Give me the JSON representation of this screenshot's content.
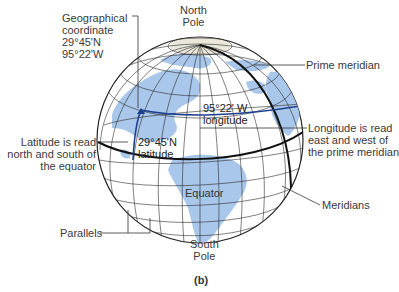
{
  "figure": {
    "panel_label": "(b)",
    "labels": {
      "geo_coordinate": [
        "Geographical",
        "coordinate",
        "29°45'N",
        "95°22'W"
      ],
      "north_pole": [
        "North",
        "Pole"
      ],
      "south_pole": [
        "South",
        "Pole"
      ],
      "prime_meridian": "Prime meridian",
      "longitude_note": [
        "Longitude is read",
        "east and west of",
        "the prime meridian"
      ],
      "latitude_note": [
        "Latitude is read",
        "north and south of",
        "the equator"
      ],
      "longitude_value": [
        "95°22' W",
        "longitude"
      ],
      "latitude_value": [
        "29°45'N",
        "latitude"
      ],
      "equator": "Equator",
      "meridians": "Meridians",
      "parallels": "Parallels"
    },
    "colors": {
      "land": "#a9c7ea",
      "ocean": "#ffffff",
      "grid": "#2a2a2a",
      "coordinate_highlight": "#1f3f8f",
      "text": "#3a3a3a"
    }
  }
}
